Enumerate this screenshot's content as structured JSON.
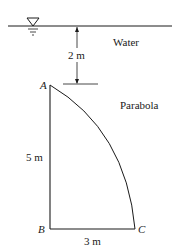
{
  "diagram": {
    "labels": {
      "water": "Water",
      "depth": "2 m",
      "curve": "Parabola",
      "height": "5 m",
      "width": "3 m"
    },
    "points": {
      "A": "A",
      "B": "B",
      "C": "C"
    },
    "colors": {
      "stroke": "#1a1a1a",
      "background": "#ffffff"
    }
  }
}
